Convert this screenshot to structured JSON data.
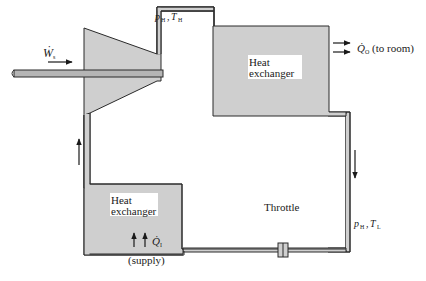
{
  "diagram": {
    "colors": {
      "fill": "#cfcfcf",
      "stroke": "#2a2a2a",
      "background": "#ffffff"
    },
    "components": {
      "compressor": {
        "label": ""
      },
      "hot_exchanger": {
        "line1": "Heat",
        "line2": "exchanger"
      },
      "cold_exchanger": {
        "line1": "Heat",
        "line2": "exchanger"
      },
      "throttle": {
        "label": "Throttle"
      }
    },
    "labels": {
      "work_symbol": "Ẇ",
      "work_sub": "s",
      "state_high_p": "p",
      "state_high_p_sub": "H",
      "state_high_t": "T",
      "state_high_t_sub": "H",
      "state_low_p": "p",
      "state_low_p_sub": "H",
      "state_low_t": "T",
      "state_low_t_sub": "L",
      "heat_out_symbol": "Q̇",
      "heat_out_sub": "O",
      "heat_out_note": "(to room)",
      "heat_in_symbol": "Q̇",
      "heat_in_sub": "I",
      "heat_in_note": "(supply)",
      "comma": ","
    }
  }
}
